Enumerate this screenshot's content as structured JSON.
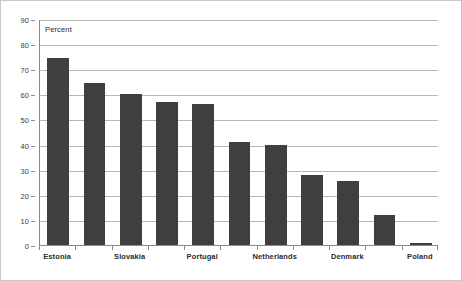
{
  "chart_data": {
    "type": "bar",
    "title": "",
    "subtitle": "",
    "annotation": "Percent",
    "xlabel": "",
    "ylabel": "",
    "ylim": [
      0,
      90
    ],
    "y_ticks": [
      0,
      10,
      20,
      30,
      40,
      50,
      60,
      70,
      80,
      90
    ],
    "y_tick_labels": [
      "0",
      "10",
      "20",
      "30",
      "40",
      "50",
      "60",
      "70",
      "80",
      "90"
    ],
    "grid": true,
    "legend": "none",
    "bar_color": "#3f3f3f",
    "gridline_color": "#b6b6b6",
    "axis_color": "#8a8a8a",
    "categories": [
      "Estonia",
      "",
      "Slovakia",
      "",
      "Portugal",
      "",
      "Netherlands",
      "",
      "Denmark",
      "",
      "Poland"
    ],
    "visible_tick_labels": [
      "Estonia",
      "Slovakia",
      "Portugal",
      "Netherlands",
      "Denmark",
      "Poland"
    ],
    "values": [
      74.5,
      64.5,
      60,
      57,
      56,
      41,
      40,
      28,
      25.5,
      12,
      1
    ]
  }
}
